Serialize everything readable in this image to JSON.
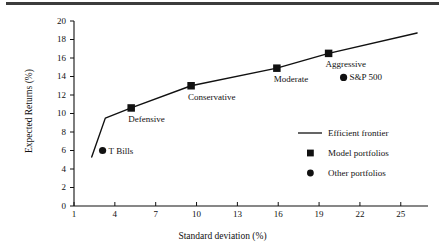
{
  "chart_data": {
    "type": "scatter",
    "title": "",
    "xlabel": "Standard deviation (%)",
    "ylabel": "Expected Returns (%)",
    "xlim": [
      1,
      27
    ],
    "ylim": [
      0,
      20
    ],
    "xticks": [
      "1",
      "4",
      "7",
      "10",
      "13",
      "16",
      "19",
      "22",
      "25"
    ],
    "xtick_values": [
      1,
      4,
      7,
      10,
      13,
      16,
      19,
      22,
      25
    ],
    "yticks": [
      "0",
      "2",
      "4",
      "6",
      "8",
      "10",
      "12",
      "14",
      "16",
      "18",
      "20"
    ],
    "ytick_values": [
      0,
      2,
      4,
      6,
      8,
      10,
      12,
      14,
      16,
      18,
      20
    ],
    "grid": false,
    "legend_position": "right-middle",
    "series": [
      {
        "name": "Efficient frontier",
        "type": "line",
        "marker": "none",
        "points": [
          {
            "x": 2.3,
            "y": 5.3
          },
          {
            "x": 3.3,
            "y": 9.5
          },
          {
            "x": 5.2,
            "y": 10.6
          },
          {
            "x": 9.6,
            "y": 13.0
          },
          {
            "x": 15.9,
            "y": 14.9
          },
          {
            "x": 19.7,
            "y": 16.5
          },
          {
            "x": 26.2,
            "y": 18.7
          }
        ]
      },
      {
        "name": "Model portfolios",
        "type": "scatter",
        "marker": "square",
        "points": [
          {
            "x": 5.2,
            "y": 10.6,
            "label": "Defensive"
          },
          {
            "x": 9.6,
            "y": 13.0,
            "label": "Conservative"
          },
          {
            "x": 15.9,
            "y": 14.9,
            "label": "Moderate"
          },
          {
            "x": 19.7,
            "y": 16.5,
            "label": "Aggressive"
          }
        ]
      },
      {
        "name": "Other portfolios",
        "type": "scatter",
        "marker": "circle",
        "points": [
          {
            "x": 3.1,
            "y": 6.0,
            "label": "T Bills"
          },
          {
            "x": 20.8,
            "y": 13.9,
            "label": "S&P 500"
          }
        ]
      }
    ],
    "annotations": [
      {
        "text": "Defensive",
        "x": 5.2,
        "y": 10.6,
        "placement": "below-right"
      },
      {
        "text": "Conservative",
        "x": 9.6,
        "y": 13.0,
        "placement": "below-right"
      },
      {
        "text": "Moderate",
        "x": 15.9,
        "y": 14.9,
        "placement": "below-right"
      },
      {
        "text": "Aggressive",
        "x": 19.7,
        "y": 16.5,
        "placement": "below-right"
      },
      {
        "text": "T Bills",
        "x": 3.1,
        "y": 6.0,
        "placement": "right"
      },
      {
        "text": "S&P 500",
        "x": 20.8,
        "y": 13.9,
        "placement": "right"
      }
    ]
  },
  "legend": {
    "items": [
      {
        "label": "Efficient frontier",
        "marker": "line"
      },
      {
        "label": "Model portfolios",
        "marker": "square"
      },
      {
        "label": "Other portfolios",
        "marker": "circle"
      }
    ]
  },
  "colors": {
    "ink": "#111111",
    "rule": "#3c3c3c",
    "background": "#ffffff"
  }
}
